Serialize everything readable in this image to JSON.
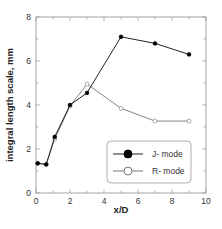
{
  "chart_data": {
    "type": "line",
    "title": "",
    "xlabel": "x/D",
    "ylabel": "integral length scale, mm",
    "xlim": [
      0,
      10
    ],
    "ylim": [
      0,
      8
    ],
    "xticks": [
      0,
      2,
      4,
      6,
      8,
      10
    ],
    "yticks": [
      0,
      2,
      4,
      6,
      8
    ],
    "grid": false,
    "legend_position": "lower right",
    "series": [
      {
        "name": "J- mode",
        "marker": "filled-circle",
        "color": "#111111",
        "x": [
          0.1,
          0.6,
          1.1,
          2.0,
          3.0,
          5.0,
          7.0,
          9.0
        ],
        "y": [
          1.35,
          1.3,
          2.55,
          4.0,
          4.55,
          7.1,
          6.8,
          6.3
        ]
      },
      {
        "name": "R- mode",
        "marker": "open-circle",
        "color": "#555555",
        "x": [
          0.1,
          0.6,
          1.1,
          2.0,
          3.0,
          5.0,
          7.0,
          9.0
        ],
        "y": [
          1.35,
          1.3,
          2.45,
          3.95,
          4.95,
          3.85,
          3.27,
          3.27
        ]
      }
    ]
  },
  "axes": {
    "xlabel": "x/D",
    "ylabel": "integral length scale, mm",
    "xtick_labels": [
      "0",
      "2",
      "4",
      "6",
      "8",
      "10"
    ],
    "ytick_labels": [
      "0",
      "2",
      "4",
      "6",
      "8"
    ]
  },
  "legend": {
    "items": [
      {
        "label": "J- mode",
        "marker": "filled-circle"
      },
      {
        "label": "R- mode",
        "marker": "open-circle"
      }
    ]
  }
}
